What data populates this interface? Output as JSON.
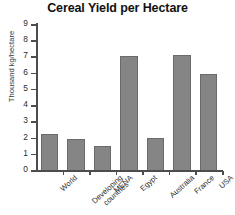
{
  "chart_data": {
    "type": "bar",
    "title": "Cereal Yield per Hectare",
    "xlabel": "",
    "ylabel": "Thousand kg/hectare",
    "ylim": [
      0,
      9
    ],
    "yticks": [
      0,
      1,
      2,
      3,
      4,
      5,
      6,
      7,
      8,
      9
    ],
    "ytick_labels": [
      "0",
      "1",
      "2",
      "3",
      "4",
      "5",
      "6",
      "7",
      "8",
      "9"
    ],
    "grid": false,
    "legend": false,
    "legend_position": "none",
    "bar_color": "#858585",
    "bar_edge_color": "#6a6a6a",
    "axis_color": "#4d4d4d",
    "background_color": "#ffffff",
    "categories": [
      "World",
      "Developing countries",
      "MENA",
      "Egypt",
      "Australia",
      "France",
      "USA"
    ],
    "category_lines": [
      [
        "World"
      ],
      [
        "Developing",
        "countries"
      ],
      [
        "MENA"
      ],
      [
        "Egypt"
      ],
      [
        "Australia"
      ],
      [
        "France"
      ],
      [
        "USA"
      ]
    ],
    "values": [
      2.2,
      1.9,
      1.5,
      7.0,
      2.0,
      7.1,
      5.9
    ],
    "series": [
      {
        "name": "Cereal yield",
        "values": [
          2.2,
          1.9,
          1.5,
          7.0,
          2.0,
          7.1,
          5.9
        ]
      }
    ]
  }
}
